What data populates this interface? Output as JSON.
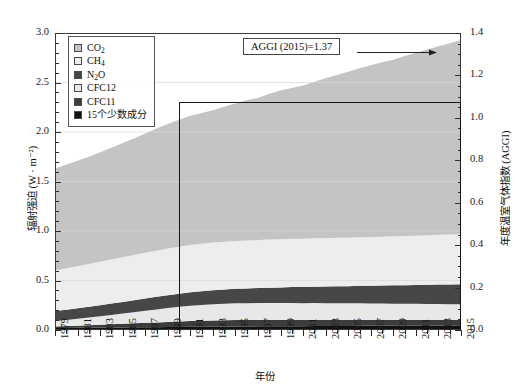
{
  "chart_data": {
    "type": "area",
    "title": "",
    "xlabel": "年份",
    "ylabel": "辐射强迫 (W · m⁻²)",
    "y2label": "年度温室气体指数 (AGGI)",
    "xlim": [
      1979,
      2015
    ],
    "ylim": [
      0.0,
      3.0
    ],
    "y2lim": [
      0.0,
      1.4
    ],
    "grid": true,
    "legend_position": "top-left",
    "stacked": true,
    "x": [
      1979,
      1980,
      1981,
      1982,
      1983,
      1984,
      1985,
      1986,
      1987,
      1988,
      1989,
      1990,
      1991,
      1992,
      1993,
      1994,
      1995,
      1996,
      1997,
      1998,
      1999,
      2000,
      2001,
      2002,
      2003,
      2004,
      2005,
      2006,
      2007,
      2008,
      2009,
      2010,
      2011,
      2012,
      2013,
      2014,
      2015
    ],
    "series": [
      {
        "name": "15个少数成分",
        "color": "#111111",
        "values": [
          0.02,
          0.021,
          0.022,
          0.023,
          0.024,
          0.025,
          0.026,
          0.027,
          0.028,
          0.029,
          0.03,
          0.031,
          0.032,
          0.033,
          0.034,
          0.035,
          0.036,
          0.036,
          0.037,
          0.038,
          0.038,
          0.039,
          0.039,
          0.04,
          0.04,
          0.041,
          0.041,
          0.042,
          0.042,
          0.043,
          0.043,
          0.044,
          0.044,
          0.045,
          0.046,
          0.046,
          0.047
        ]
      },
      {
        "name": "CFC11",
        "color": "#3c3c3c",
        "values": [
          0.016,
          0.019,
          0.022,
          0.025,
          0.028,
          0.032,
          0.036,
          0.04,
          0.044,
          0.048,
          0.052,
          0.055,
          0.058,
          0.06,
          0.062,
          0.063,
          0.064,
          0.064,
          0.064,
          0.064,
          0.063,
          0.063,
          0.062,
          0.062,
          0.061,
          0.061,
          0.06,
          0.06,
          0.059,
          0.058,
          0.058,
          0.057,
          0.057,
          0.056,
          0.055,
          0.055,
          0.054
        ]
      },
      {
        "name": "CFC12",
        "color": "#e8e8e8",
        "values": [
          0.055,
          0.062,
          0.07,
          0.078,
          0.086,
          0.095,
          0.104,
          0.113,
          0.122,
          0.131,
          0.14,
          0.148,
          0.155,
          0.16,
          0.164,
          0.167,
          0.169,
          0.17,
          0.171,
          0.171,
          0.171,
          0.171,
          0.17,
          0.17,
          0.169,
          0.169,
          0.168,
          0.167,
          0.167,
          0.166,
          0.165,
          0.164,
          0.163,
          0.162,
          0.161,
          0.16,
          0.159
        ]
      },
      {
        "name": "N₂O",
        "color": "#474747",
        "values": [
          0.1,
          0.103,
          0.106,
          0.109,
          0.112,
          0.115,
          0.118,
          0.121,
          0.124,
          0.127,
          0.13,
          0.133,
          0.136,
          0.139,
          0.142,
          0.144,
          0.147,
          0.15,
          0.152,
          0.155,
          0.158,
          0.161,
          0.163,
          0.166,
          0.169,
          0.172,
          0.174,
          0.177,
          0.18,
          0.183,
          0.186,
          0.188,
          0.191,
          0.194,
          0.197,
          0.199,
          0.202
        ]
      },
      {
        "name": "CH₄",
        "color": "#ededed",
        "values": [
          0.41,
          0.418,
          0.425,
          0.432,
          0.439,
          0.445,
          0.451,
          0.457,
          0.462,
          0.466,
          0.47,
          0.474,
          0.477,
          0.479,
          0.481,
          0.482,
          0.483,
          0.484,
          0.484,
          0.486,
          0.487,
          0.487,
          0.487,
          0.488,
          0.488,
          0.488,
          0.489,
          0.49,
          0.491,
          0.493,
          0.495,
          0.497,
          0.498,
          0.5,
          0.502,
          0.504,
          0.507
        ]
      },
      {
        "name": "CO₂",
        "color": "#c4c4c4",
        "values": [
          1.027,
          1.048,
          1.065,
          1.083,
          1.106,
          1.13,
          1.153,
          1.177,
          1.204,
          1.234,
          1.26,
          1.283,
          1.307,
          1.321,
          1.336,
          1.363,
          1.388,
          1.416,
          1.436,
          1.473,
          1.501,
          1.523,
          1.549,
          1.581,
          1.617,
          1.644,
          1.676,
          1.707,
          1.735,
          1.761,
          1.784,
          1.817,
          1.846,
          1.877,
          1.906,
          1.932,
          1.961
        ]
      }
    ],
    "reference_rectangle": {
      "label": "AGGI = 1 (1990)",
      "x_start": 1990,
      "x_end": 2015,
      "y_value": 2.3
    },
    "annotation": {
      "text": "AGGI (2015)=1.37",
      "arrow": "right"
    },
    "y_ticks": [
      "0.0",
      "0.5",
      "1.0",
      "1.5",
      "2.0",
      "2.5",
      "3.0"
    ],
    "y2_ticks": [
      "0.0",
      "0.2",
      "0.4",
      "0.6",
      "0.8",
      "1.0",
      "1.2",
      "1.4"
    ],
    "x_ticks": [
      "1979",
      "1981",
      "1983",
      "1985",
      "1987",
      "1989",
      "1991",
      "1993",
      "1995",
      "1997",
      "1999",
      "2001",
      "2003",
      "2005",
      "2007",
      "2009",
      "2011",
      "2013",
      "2015"
    ]
  },
  "legend": {
    "items": [
      {
        "label": "CO",
        "sub": "2",
        "color": "#c4c4c4"
      },
      {
        "label": "CH",
        "sub": "4",
        "color": "#ededed"
      },
      {
        "label": "N",
        "sub": "2",
        "label2": "O",
        "color": "#474747"
      },
      {
        "label": "CFC12",
        "sub": "",
        "color": "#e8e8e8"
      },
      {
        "label": "CFC11",
        "sub": "",
        "color": "#3c3c3c"
      },
      {
        "label": "15个少数成分",
        "sub": "",
        "color": "#111111"
      }
    ]
  },
  "colors": {
    "frame": "#3a3a3a",
    "grid": "#d8d8d8",
    "ref_rect": "#171717",
    "background": "#ffffff"
  }
}
